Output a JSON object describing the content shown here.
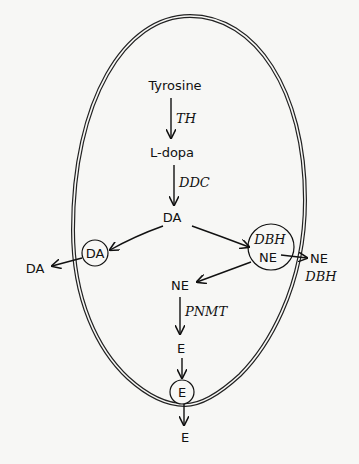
{
  "diagram": {
    "type": "catecholamine-biosynthesis-pathway",
    "compartment": "cell",
    "nodes": {
      "tyrosine": "Tyrosine",
      "ldopa": "L-dopa",
      "da": "DA",
      "da_vesicle": "DA",
      "da_released": "DA",
      "vesicle_enzyme": "DBH",
      "ne_vesicle": "NE",
      "ne_released": "NE",
      "dbh_released": "DBH",
      "ne_cytosol": "NE",
      "e_cytosol": "E",
      "e_vesicle": "E",
      "e_released": "E"
    },
    "enzymes": {
      "step1": "TH",
      "step2": "DDC",
      "step3": "PNMT"
    },
    "edges": [
      {
        "from": "Tyrosine",
        "to": "L-dopa",
        "label": "TH"
      },
      {
        "from": "L-dopa",
        "to": "DA",
        "label": "DDC"
      },
      {
        "from": "DA",
        "to": "DA (vesicle)"
      },
      {
        "from": "DA (vesicle)",
        "to": "DA (released)"
      },
      {
        "from": "DA",
        "to": "DBH/NE vesicle"
      },
      {
        "from": "NE (vesicle)",
        "to": "NE + DBH (released)"
      },
      {
        "from": "NE (vesicle)",
        "to": "NE (cytosol)"
      },
      {
        "from": "NE (cytosol)",
        "to": "E",
        "label": "PNMT"
      },
      {
        "from": "E",
        "to": "E (vesicle)"
      },
      {
        "from": "E (vesicle)",
        "to": "E (released)"
      }
    ]
  }
}
